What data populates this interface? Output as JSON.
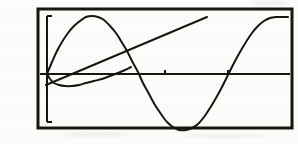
{
  "figure": {
    "problem_number": "19.",
    "problem_part": "a.",
    "caption": "",
    "background_color": "#fdfdfc",
    "ink_color": "#16150f",
    "frame": {
      "x": 38,
      "y": 9,
      "width": 254,
      "height": 119,
      "stroke_width": 3
    }
  },
  "chart_data": {
    "type": "line",
    "title": "",
    "subtitle": "",
    "xlabel": "",
    "ylabel": "",
    "grid": false,
    "legend": "none",
    "axis_style": "graphing-calculator",
    "xlim": [
      0,
      10
    ],
    "ylim": [
      -4,
      4
    ],
    "x_axis": {
      "pixel_y": 74,
      "pixel_x_start": 40,
      "pixel_x_end": 290,
      "tick_pixels": [
        165,
        228
      ],
      "tick_values": [
        5,
        7.5
      ],
      "tick_length": 4
    },
    "y_axis": {
      "pixel_x": 47,
      "pixel_y_top": 16,
      "pixel_y_bottom": 122,
      "tick_pixels": [
        16,
        122
      ],
      "tick_values": [
        4,
        -4
      ],
      "tick_length": 5
    },
    "series": [
      {
        "name": "sine-wave",
        "type": "line",
        "stroke_width": 2,
        "color": "#16150f",
        "points_pixel": [
          [
            47,
            74
          ],
          [
            52,
            62
          ],
          [
            57,
            51
          ],
          [
            62,
            42
          ],
          [
            68,
            33
          ],
          [
            74,
            26
          ],
          [
            80,
            21
          ],
          [
            86,
            17
          ],
          [
            92,
            16
          ],
          [
            98,
            17
          ],
          [
            104,
            20
          ],
          [
            110,
            26
          ],
          [
            116,
            33
          ],
          [
            121,
            41
          ],
          [
            127,
            51
          ],
          [
            132,
            61
          ],
          [
            138,
            72
          ],
          [
            143,
            83
          ],
          [
            149,
            94
          ],
          [
            155,
            105
          ],
          [
            161,
            114
          ],
          [
            167,
            122
          ],
          [
            173,
            127
          ],
          [
            179,
            130
          ],
          [
            186,
            130
          ],
          [
            192,
            128
          ],
          [
            198,
            124
          ],
          [
            204,
            117
          ],
          [
            210,
            108
          ],
          [
            216,
            98
          ],
          [
            222,
            87
          ],
          [
            228,
            75
          ],
          [
            234,
            63
          ],
          [
            240,
            52
          ],
          [
            246,
            42
          ],
          [
            252,
            33
          ],
          [
            258,
            26
          ],
          [
            264,
            21
          ],
          [
            270,
            18
          ],
          [
            276,
            17
          ],
          [
            282,
            17
          ],
          [
            288,
            17
          ]
        ],
        "values": [
          0,
          1,
          2,
          2.9,
          3.5,
          3.9,
          4,
          3.8,
          3.2,
          2.3,
          1.1,
          -0.2,
          -1.5,
          -2.7,
          -3.5,
          -3.9,
          -3.9,
          -3.4,
          -2.5,
          -1.3,
          0,
          1.4,
          2.6,
          3.4,
          3.9,
          4,
          4
        ]
      },
      {
        "name": "ascending-line",
        "type": "line",
        "stroke_width": 2,
        "color": "#16150f",
        "points_pixel": [
          [
            46,
            85
          ],
          [
            207,
            17
          ]
        ],
        "slope_pixel": -0.422,
        "values": [
          -1.2,
          4.0
        ]
      },
      {
        "name": "shallow-dip-curve",
        "type": "line",
        "stroke_width": 2,
        "color": "#16150f",
        "points_pixel": [
          [
            47,
            74
          ],
          [
            50,
            79
          ],
          [
            54,
            83
          ],
          [
            59,
            85
          ],
          [
            65,
            86
          ],
          [
            72,
            86
          ],
          [
            79,
            85
          ],
          [
            86,
            83
          ],
          [
            94,
            81
          ],
          [
            102,
            79
          ],
          [
            110,
            76
          ],
          [
            118,
            73
          ],
          [
            125,
            70
          ],
          [
            131,
            67
          ]
        ],
        "values": [
          0,
          -0.3,
          -0.55,
          -0.62,
          -0.64,
          -0.63,
          -0.58,
          -0.5,
          -0.4,
          -0.28,
          -0.13,
          0.02,
          0.15,
          0.25
        ]
      }
    ],
    "annotations": []
  }
}
